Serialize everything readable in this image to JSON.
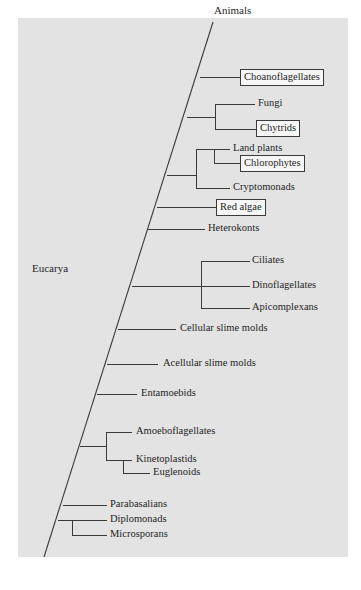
{
  "diagram": {
    "type": "phylogenetic-tree",
    "root_label": "Eucarya",
    "top_label": "Animals",
    "colors": {
      "panel_background": "#e3e3e3",
      "line": "#3a3a3a",
      "text": "#1f1f1f",
      "highlight_box_fill": "#f6f6f6"
    },
    "taxa": {
      "animals": "Animals",
      "choanoflagellates": "Choanoflagellates",
      "fungi": "Fungi",
      "chytrids": "Chytrids",
      "land_plants": "Land plants",
      "chlorophytes": "Chlorophytes",
      "cryptomonads": "Cryptomonads",
      "red_algae": "Red algae",
      "heterokonts": "Heterokonts",
      "ciliates": "Ciliates",
      "dinoflagellates": "Dinoflagellates",
      "apicomplexans": "Apicomplexans",
      "cellular_slime_molds": "Cellular slime molds",
      "acellular_slime_molds": "Acellular slime molds",
      "entamoebids": "Entamoebids",
      "amoeboflagellates": "Amoeboflagellates",
      "kinetoplastids": "Kinetoplastids",
      "euglenoids": "Euglenoids",
      "parabasalians": "Parabasalians",
      "diplomonads": "Diplomonads",
      "microsporans": "Microsporans"
    },
    "boxed_taxa": [
      "Choanoflagellates",
      "Chytrids",
      "Chlorophytes",
      "Red algae"
    ],
    "clades_top_to_bottom": [
      [
        "Animals"
      ],
      [
        "Choanoflagellates"
      ],
      [
        "Fungi",
        "Chytrids"
      ],
      [
        [
          "Land plants",
          "Chlorophytes"
        ],
        "Cryptomonads"
      ],
      [
        "Red algae"
      ],
      [
        "Heterokonts"
      ],
      [
        "Ciliates",
        "Dinoflagellates",
        "Apicomplexans"
      ],
      [
        "Cellular slime molds"
      ],
      [
        "Acellular slime molds"
      ],
      [
        "Entamoebids"
      ],
      [
        "Amoeboflagellates",
        [
          "Kinetoplastids",
          "Euglenoids"
        ]
      ],
      [
        "Parabasalians"
      ],
      [
        "Diplomonads",
        "Microsporans"
      ]
    ]
  }
}
